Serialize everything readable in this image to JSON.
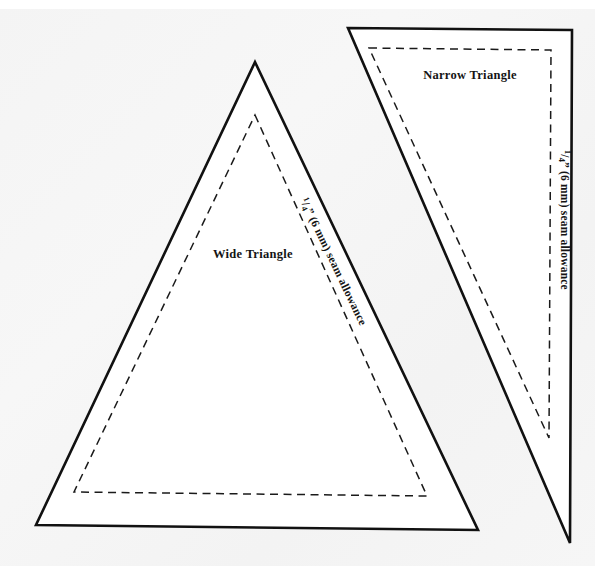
{
  "document": {
    "kind": "sewing-pattern-template-sheet",
    "background_color": "#f5f5f5",
    "ink_color": "#111111",
    "page_width": 595,
    "page_height": 566
  },
  "shapes": [
    {
      "id": "wide-triangle",
      "label": "Wide Triangle",
      "seam_allowance_label_parts": {
        "numerator": "1",
        "denominator": "4",
        "rest": "” (6 mm) seam allowance"
      },
      "seam_allowance_label": "1/4” (6 mm) seam allowance",
      "cut_line_style": "solid",
      "seam_line_style": "dashed",
      "outline_points": "255,62 478,530 36,525",
      "seam_points": "255,115 427,496 74,492",
      "label_position": {
        "x": 253,
        "y": 258
      },
      "seam_label_position": {
        "x": 300,
        "y": 200
      },
      "seam_label_rotation": 64.5
    },
    {
      "id": "narrow-triangle",
      "label": "Narrow Triangle",
      "seam_allowance_label_parts": {
        "numerator": "1",
        "denominator": "4",
        "rest": "” (6 mm) seam allowance"
      },
      "seam_allowance_label": "1/4” (6 mm) seam allowance",
      "cut_line_style": "solid",
      "seam_line_style": "dashed",
      "outline_points": "348,28 572,30 570,543",
      "seam_points": "369,48 551,50 549,438",
      "label_position": {
        "x": 470,
        "y": 79
      },
      "seam_label_position": {
        "x": 561,
        "y": 150
      },
      "seam_label_rotation": 90
    }
  ],
  "legend": {
    "solid_line_meaning": "cutting line",
    "dashed_line_meaning": "seam line"
  }
}
